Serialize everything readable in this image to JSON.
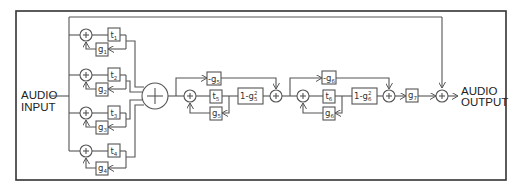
{
  "diagram": {
    "type": "audio reverb signal flow (parallel comb filters + series allpass)",
    "input_label": [
      "AUDIO",
      "INPUT"
    ],
    "output_label": [
      "AUDIO",
      "OUTPUT"
    ],
    "comb_filters": [
      {
        "delay": "t",
        "delay_sub": "1",
        "gain": "g",
        "gain_sub": "1"
      },
      {
        "delay": "t",
        "delay_sub": "2",
        "gain": "g",
        "gain_sub": "2"
      },
      {
        "delay": "t",
        "delay_sub": "3",
        "gain": "g",
        "gain_sub": "3"
      },
      {
        "delay": "t",
        "delay_sub": "4",
        "gain": "g",
        "gain_sub": "4"
      }
    ],
    "allpass_filters": [
      {
        "ff": "-g",
        "ff_sub": "5",
        "delay": "t",
        "delay_sub": "5",
        "fb": "g",
        "fb_sub": "5",
        "out": "1-g",
        "out_sup": "2",
        "out_sub": "5"
      },
      {
        "ff": "-g",
        "ff_sub": "6",
        "delay": "t",
        "delay_sub": "6",
        "fb": "g",
        "fb_sub": "6",
        "out": "1-g",
        "out_sup": "2",
        "out_sub": "6"
      }
    ],
    "output_gain": {
      "label": "g",
      "sub": "7"
    },
    "colors": {
      "line": "#555555",
      "frame": "#333333",
      "text": "#222222"
    }
  }
}
